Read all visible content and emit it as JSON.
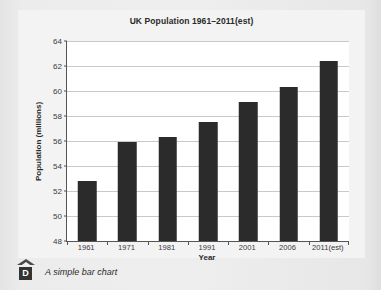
{
  "figure": {
    "caption": "A simple bar chart",
    "badge_letter": "D"
  },
  "chart_data": {
    "type": "bar",
    "title": "UK Population 1961–2011(est)",
    "xlabel": "Year",
    "ylabel": "Population (millions)",
    "categories": [
      "1961",
      "1971",
      "1981",
      "1991",
      "2001",
      "2006",
      "2011(est)"
    ],
    "values": [
      52.8,
      55.9,
      56.35,
      57.5,
      59.1,
      60.3,
      62.4
    ],
    "ylim": [
      48,
      64
    ],
    "yticks": [
      48,
      50,
      52,
      54,
      56,
      58,
      60,
      62,
      64
    ],
    "ytick_labels": [
      "48",
      "50",
      "52",
      "54",
      "56",
      "58",
      "60",
      "62",
      "64"
    ],
    "grid": true,
    "legend": null,
    "bar_color": "#2b2b2b",
    "plot_background": "#ffffff",
    "gridline_color": "#c9c9c9"
  }
}
